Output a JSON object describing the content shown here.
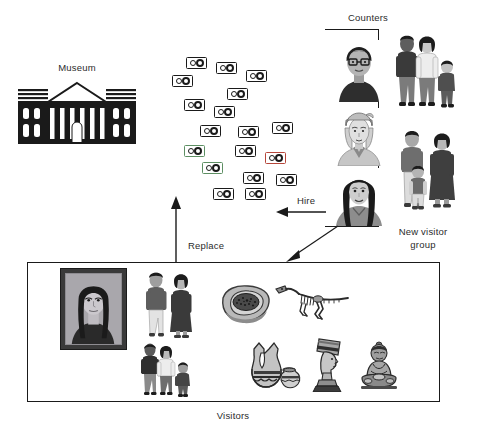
{
  "figure": {
    "type": "conceptual-diagram",
    "domain": "museum visitor counting simulation",
    "background_color": "#ffffff",
    "ink_color": "#1a1a1a",
    "text_color": "#2b2b2b"
  },
  "labels": {
    "museum": "Museum",
    "counters": "Counters",
    "hire": "Hire",
    "replace": "Replace",
    "new_visitor_group_line1": "New visitor",
    "new_visitor_group_line2": "group",
    "visitors": "Visitors"
  },
  "museum": {
    "icon_name": "museum-building-icon",
    "description": "classical neoclassical museum facade with pediment, six columns and rows of windows",
    "fill": "#1a1a1a"
  },
  "counter_devices": {
    "icon_name": "tally-counter-icon",
    "description": "small handheld dual-dial tally counter devices scattered in a cloud",
    "count": 18,
    "default_outline": "#1a1a1a",
    "tint_red": "#b6463a",
    "tint_green": "#5d8f63",
    "items": [
      {
        "x": 186,
        "y": 57,
        "tint": "none"
      },
      {
        "x": 216,
        "y": 62,
        "tint": "none"
      },
      {
        "x": 246,
        "y": 70,
        "tint": "none"
      },
      {
        "x": 172,
        "y": 75,
        "tint": "none"
      },
      {
        "x": 227,
        "y": 88,
        "tint": "none"
      },
      {
        "x": 184,
        "y": 99,
        "tint": "none"
      },
      {
        "x": 214,
        "y": 106,
        "tint": "none"
      },
      {
        "x": 200,
        "y": 125,
        "tint": "none"
      },
      {
        "x": 238,
        "y": 126,
        "tint": "none"
      },
      {
        "x": 272,
        "y": 122,
        "tint": "none"
      },
      {
        "x": 184,
        "y": 145,
        "tint": "green"
      },
      {
        "x": 235,
        "y": 145,
        "tint": "none"
      },
      {
        "x": 265,
        "y": 152,
        "tint": "red"
      },
      {
        "x": 202,
        "y": 162,
        "tint": "green"
      },
      {
        "x": 243,
        "y": 172,
        "tint": "none"
      },
      {
        "x": 276,
        "y": 174,
        "tint": "none"
      },
      {
        "x": 213,
        "y": 188,
        "tint": "none"
      },
      {
        "x": 245,
        "y": 188,
        "tint": "none"
      }
    ]
  },
  "counter_staff": {
    "group_name": "counters-staff-portraits",
    "bracket": {
      "x": 325,
      "y": 29,
      "width": 54,
      "height": 198
    },
    "portraits": [
      {
        "name": "counter-portrait-man-glasses",
        "description": "man with short dark hair wearing glasses, dark shirt",
        "y": 40
      },
      {
        "name": "counter-portrait-woman-headscarf",
        "description": "fair haired woman with head wrap and scarf",
        "y": 110
      },
      {
        "name": "counter-portrait-woman-dark-hair",
        "description": "woman with long straight dark hair",
        "y": 172
      }
    ]
  },
  "visitor_groups_right": [
    {
      "name": "new-visitor-group-family-1",
      "description": "family of three standing: man in dark sweater, woman in white blouse, small child",
      "x": 390,
      "y": 35,
      "width": 72,
      "height": 80
    },
    {
      "name": "new-visitor-group-family-2",
      "description": "family of three: man in shirt, small child in overalls, woman in dark dress",
      "x": 390,
      "y": 130,
      "width": 72,
      "height": 85
    }
  ],
  "visitors_box": {
    "frame": {
      "x": 27,
      "y": 262,
      "width": 413,
      "height": 140
    },
    "exhibits": [
      {
        "name": "mona-lisa-painting",
        "label_text": "framed portrait painting (Mona Lisa)",
        "x": 60,
        "y": 268,
        "width": 67,
        "height": 82
      },
      {
        "name": "fossil-specimen",
        "label_text": "fossil / meteorite slab specimen in grey rock",
        "x": 222,
        "y": 285,
        "width": 50,
        "height": 38
      },
      {
        "name": "dinosaur-skeleton",
        "label_text": "mounted dinosaur skeleton with long tail",
        "x": 275,
        "y": 283,
        "width": 70,
        "height": 42
      },
      {
        "name": "pottery-vessels",
        "label_text": "two painted ceramic pots",
        "x": 245,
        "y": 345,
        "width": 55,
        "height": 45
      },
      {
        "name": "nefertiti-bust",
        "label_text": "bust of Nefertiti on plinth",
        "x": 310,
        "y": 340,
        "width": 38,
        "height": 48
      },
      {
        "name": "buddha-statue",
        "label_text": "seated Buddha statue",
        "x": 358,
        "y": 343,
        "width": 44,
        "height": 45
      }
    ],
    "visitor_figures": [
      {
        "name": "visitor-group-pair",
        "label_text": "a man and a woman standing",
        "x": 140,
        "y": 272,
        "width": 58,
        "height": 68
      },
      {
        "name": "visitor-group-family",
        "label_text": "family of three: man, woman and child",
        "x": 140,
        "y": 345,
        "width": 60,
        "height": 55
      }
    ]
  },
  "arrows": [
    {
      "name": "replace-arrow",
      "label": "Replace",
      "from": "visitors box (bottom)",
      "to": "counter device cloud (top)",
      "direction": "up",
      "x1": 175,
      "y1": 262,
      "x2": 175,
      "y2": 198,
      "style": "solid with filled arrowhead"
    },
    {
      "name": "hire-arrow",
      "label": "Hire",
      "from": "counter staff portraits",
      "to": "counter device cloud",
      "direction": "left",
      "x1": 325,
      "y1": 211,
      "x2": 279,
      "y2": 211,
      "style": "solid with filled arrowhead"
    },
    {
      "name": "new-visitor-arrow",
      "label": "",
      "from": "new visitor group bracket (bottom)",
      "to": "visitors box (upper right)",
      "direction": "down-left diagonal",
      "x1": 336,
      "y1": 229,
      "x2": 288,
      "y2": 259,
      "style": "solid thin with filled arrowhead"
    }
  ],
  "label_positions": {
    "museum": {
      "x": 77,
      "y": 69
    },
    "counters": {
      "x": 368,
      "y": 19
    },
    "hire": {
      "x": 307,
      "y": 202
    },
    "replace": {
      "x": 205,
      "y": 246
    },
    "new_visitor_group": {
      "x": 421,
      "y": 232
    },
    "visitors": {
      "x": 233,
      "y": 416
    }
  }
}
